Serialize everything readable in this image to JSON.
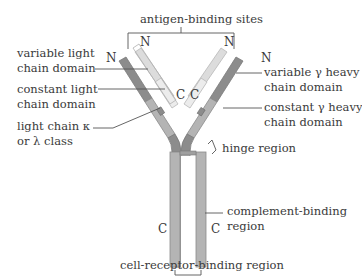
{
  "labels": {
    "antigen_binding_sites": "antigen-binding sites",
    "variable_light_1": "variable light",
    "variable_light_2": "chain domain",
    "constant_light_1": "constant light",
    "constant_light_2": "chain domain",
    "light_class_1": "light chain κ",
    "light_class_2": "or λ class",
    "variable_heavy_1": "variable γ heavy",
    "variable_heavy_2": "chain domain",
    "constant_heavy_1": "constant γ heavy",
    "constant_heavy_2": "chain domain",
    "hinge": "hinge region",
    "complement_1": "complement-binding",
    "complement_2": "region",
    "cell_receptor": "cell-receptor-binding region"
  },
  "termini": {
    "n_left_heavy": "N",
    "n_left_light": "N",
    "n_right_light": "N",
    "n_right_heavy": "N",
    "c_left_light": "C",
    "c_right_light": "C",
    "c_left_heavy": "C",
    "c_right_heavy": "C"
  },
  "colors": {
    "heavy_variable": "#8c8c8c",
    "heavy_constant": "#b4b4b4",
    "light_variable": "#dcdcdc",
    "light_constant": "#ececec",
    "outline": "#8a8a8a",
    "leader": "#555555",
    "text": "#3a3a3a"
  }
}
